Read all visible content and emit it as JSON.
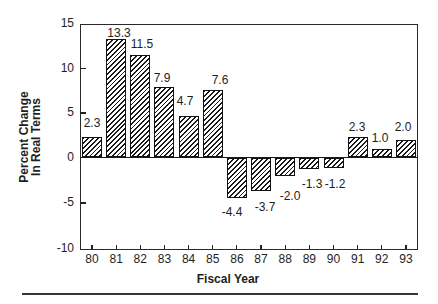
{
  "chart_data": {
    "type": "bar",
    "title": "",
    "xlabel": "Fiscal Year",
    "ylabel": "Percent Change In Real Terms",
    "ylabel_lines": [
      "Percent Change",
      "In Real Terms"
    ],
    "categories": [
      "80",
      "81",
      "82",
      "83",
      "84",
      "85",
      "86",
      "87",
      "88",
      "89",
      "90",
      "91",
      "92",
      "93"
    ],
    "values": [
      2.3,
      13.3,
      11.5,
      7.9,
      4.7,
      7.6,
      -4.4,
      -3.7,
      -2.0,
      -1.3,
      -1.2,
      2.3,
      1.0,
      2.0
    ],
    "value_labels": [
      "2.3",
      "13.3",
      "11.5",
      "7.9",
      "4.7",
      "7.6",
      "-4.4",
      "-3.7",
      "-2.0",
      "-1.3",
      "-1.2",
      "2.3",
      "1.0",
      "2.0"
    ],
    "ylim": [
      -10,
      15
    ],
    "yticks": [
      15,
      10,
      5,
      0,
      -5,
      -10
    ],
    "ytick_labels": [
      "15",
      "10",
      "5",
      "0",
      "-5",
      "-10"
    ],
    "grid": false,
    "legend": null,
    "bar_fill": "diagonal-hatch",
    "colors": {
      "ink": "#1e1e1e",
      "background": "#ffffff"
    }
  }
}
